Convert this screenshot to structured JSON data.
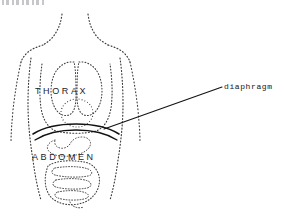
{
  "figure": {
    "title_fragment": "",
    "background_color": "#ffffff",
    "ink_color": "#1d1d1d",
    "dotted_ink_color": "#3a3a3a",
    "width": 285,
    "height": 216
  },
  "region_labels": [
    {
      "id": "thorax",
      "text": "THORAX"
    },
    {
      "id": "abdomen",
      "text": "ABDOMEN"
    }
  ],
  "callouts": [
    {
      "id": "diaphragm",
      "text": "diaphragm",
      "leader_start_x": 222,
      "leader_start_y": 87,
      "leader_end_x": 104,
      "leader_end_y": 129
    }
  ],
  "anatomy_parts": [
    {
      "name": "body-outline",
      "style": "dotted"
    },
    {
      "name": "neck-outline",
      "style": "dotted"
    },
    {
      "name": "left-arm-outline",
      "style": "dotted"
    },
    {
      "name": "right-arm-outline",
      "style": "dotted"
    },
    {
      "name": "rib-cage-outline",
      "style": "dotted"
    },
    {
      "name": "left-lung",
      "style": "dotted"
    },
    {
      "name": "right-lung",
      "style": "dotted"
    },
    {
      "name": "heart",
      "style": "dotted"
    },
    {
      "name": "diaphragm",
      "style": "solid"
    },
    {
      "name": "stomach",
      "style": "dotted"
    },
    {
      "name": "intestines",
      "style": "dotted"
    }
  ]
}
